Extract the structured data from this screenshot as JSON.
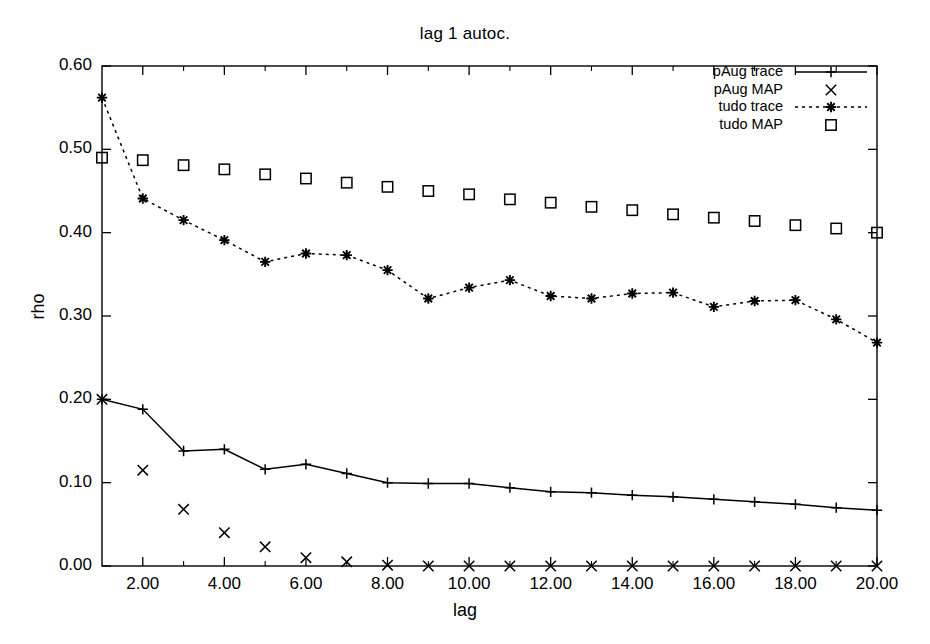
{
  "chart_data": {
    "type": "line",
    "title": "lag 1 autoc.",
    "xlabel": "lag",
    "ylabel": "rho",
    "xlim": [
      1,
      20
    ],
    "ylim": [
      0.0,
      0.6
    ],
    "xticks": [
      "2.00",
      "4.00",
      "6.00",
      "8.00",
      "10.00",
      "12.00",
      "14.00",
      "16.00",
      "18.00",
      "20.00"
    ],
    "xtick_values": [
      2,
      4,
      6,
      8,
      10,
      12,
      14,
      16,
      18,
      20
    ],
    "xminor_values": [
      3,
      5,
      7,
      9,
      11,
      13,
      15,
      17,
      19
    ],
    "yticks": [
      "0.00",
      "0.10",
      "0.20",
      "0.30",
      "0.40",
      "0.50",
      "0.60"
    ],
    "ytick_values": [
      0.0,
      0.1,
      0.2,
      0.3,
      0.4,
      0.5,
      0.6
    ],
    "grid": false,
    "legend_position": "top-right inside",
    "x": [
      1,
      2,
      3,
      4,
      5,
      6,
      7,
      8,
      9,
      10,
      11,
      12,
      13,
      14,
      15,
      16,
      17,
      18,
      19,
      20
    ],
    "series": [
      {
        "name": "pAug trace",
        "style": "solid-line",
        "marker": "plus",
        "values": [
          0.2,
          0.188,
          0.138,
          0.14,
          0.116,
          0.122,
          0.111,
          0.1,
          0.099,
          0.099,
          0.094,
          0.089,
          0.088,
          0.085,
          0.083,
          0.08,
          0.077,
          0.074,
          0.07,
          0.067
        ]
      },
      {
        "name": "pAug MAP",
        "style": "markers-only",
        "marker": "cross",
        "values": [
          0.2,
          0.115,
          0.068,
          0.04,
          0.023,
          0.01,
          0.005,
          0.001,
          0.0,
          0.0,
          0.0,
          0.0,
          0.0,
          0.0,
          0.0,
          0.0,
          0.0,
          0.0,
          0.0,
          0.0
        ]
      },
      {
        "name": "tudo trace",
        "style": "dashed-line",
        "marker": "asterisk",
        "values": [
          0.562,
          0.441,
          0.415,
          0.391,
          0.365,
          0.375,
          0.373,
          0.355,
          0.321,
          0.334,
          0.343,
          0.324,
          0.321,
          0.327,
          0.328,
          0.311,
          0.318,
          0.319,
          0.296,
          0.268
        ]
      },
      {
        "name": "tudo MAP",
        "style": "markers-only",
        "marker": "square",
        "values": [
          0.49,
          0.487,
          0.481,
          0.476,
          0.47,
          0.465,
          0.46,
          0.455,
          0.45,
          0.446,
          0.44,
          0.436,
          0.431,
          0.427,
          0.422,
          0.418,
          0.414,
          0.409,
          0.405,
          0.4
        ]
      }
    ],
    "colors": {
      "foreground": "#000000",
      "background": "#ffffff"
    }
  },
  "legend": {
    "items": [
      {
        "label": "pAug trace"
      },
      {
        "label": "pAug MAP"
      },
      {
        "label": "tudo trace"
      },
      {
        "label": "tudo MAP"
      }
    ]
  }
}
